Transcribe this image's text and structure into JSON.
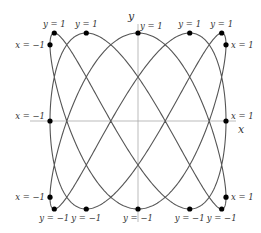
{
  "diagram": {
    "type": "lissajous-curve",
    "parametric": {
      "x": "sin(3t)",
      "y": "cos(5t)"
    },
    "axes": {
      "x_label": "x",
      "y_label": "y"
    },
    "colors": {
      "curve": "#555555",
      "axis": "#aaaaaa",
      "point": "#000000",
      "text": "#333333"
    },
    "points": [
      {
        "x": 0,
        "y": 1,
        "label": "y = 1"
      },
      {
        "x": -0.5878,
        "y": 1,
        "label": "y = 1"
      },
      {
        "x": 0.9511,
        "y": 1,
        "label": "y = 1"
      },
      {
        "x": -0.9511,
        "y": 1,
        "label": "y = 1"
      },
      {
        "x": 0.5878,
        "y": 1,
        "label": "y = 1"
      },
      {
        "x": 0,
        "y": -1,
        "label": "y = −1"
      },
      {
        "x": -0.5878,
        "y": -1,
        "label": "y = −1"
      },
      {
        "x": 0.9511,
        "y": -1,
        "label": "y = −1"
      },
      {
        "x": -0.9511,
        "y": -1,
        "label": "y = −1"
      },
      {
        "x": 0.5878,
        "y": -1,
        "label": "y = −1"
      },
      {
        "x": 1,
        "y": -0.866,
        "label": "x = 1"
      },
      {
        "x": 1,
        "y": 0,
        "label": "x = 1"
      },
      {
        "x": 1,
        "y": 0.866,
        "label": "x = 1"
      },
      {
        "x": -1,
        "y": -0.866,
        "label": "x = −1"
      },
      {
        "x": -1,
        "y": 0,
        "label": "x = −1"
      },
      {
        "x": -1,
        "y": 0.866,
        "label": "x = −1"
      }
    ]
  }
}
